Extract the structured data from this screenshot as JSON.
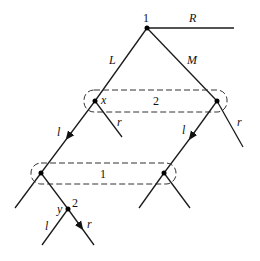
{
  "diagram": {
    "type": "extensive-form game tree",
    "colors": {
      "line": "#1a1a1a",
      "background": "#ffffff"
    },
    "root": {
      "player_label": "1"
    },
    "root_actions": {
      "left": "L",
      "middle": "M",
      "right": "R"
    },
    "info_set_2": {
      "label": "2",
      "node_left_label": "x"
    },
    "player2_actions": {
      "left_node": {
        "l": "l",
        "r": "r"
      },
      "right_node": {
        "l": "l",
        "r": "r"
      }
    },
    "info_set_1": {
      "label": "1"
    },
    "final_node": {
      "player_label": "2",
      "node_label": "y",
      "l": "l",
      "r": "r"
    }
  }
}
